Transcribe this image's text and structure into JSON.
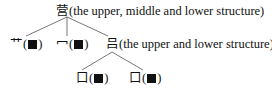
{
  "tree": {
    "root": {
      "char": "营",
      "desc": "(the upper, middle and lower structure)"
    },
    "level1": [
      {
        "char": "艹",
        "open": "(",
        "close": ")"
      },
      {
        "char": "冖",
        "open": "(",
        "close": ")"
      },
      {
        "char": "吕",
        "desc": "(the upper and lower structure)"
      }
    ],
    "level2": [
      {
        "char": "口",
        "open": "(",
        "close": ")"
      },
      {
        "char": "口",
        "open": "(",
        "close": ")"
      }
    ]
  },
  "colors": {
    "text": "#111111",
    "line": "#555555",
    "background": "#ffffff"
  }
}
